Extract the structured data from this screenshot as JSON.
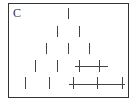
{
  "figure": {
    "label": "C",
    "line_color": "#444444",
    "frame_color": "#333333",
    "rows": [
      {
        "ticks": [
          68
        ],
        "y_top": 8,
        "height": 11
      },
      {
        "ticks": [
          57,
          79
        ],
        "y_top": 26,
        "height": 11
      },
      {
        "ticks": [
          46,
          68,
          89
        ],
        "y_top": 43,
        "height": 11
      },
      {
        "ticks": [
          35,
          57,
          79,
          99
        ],
        "y_top": 60,
        "height": 12,
        "hline": {
          "x1": 75,
          "x2": 108,
          "y": 66
        }
      },
      {
        "ticks": [
          25,
          49,
          73,
          97,
          122
        ],
        "y_top": 77,
        "height": 12,
        "hline": {
          "x1": 69,
          "x2": 125,
          "y": 84
        }
      }
    ]
  }
}
